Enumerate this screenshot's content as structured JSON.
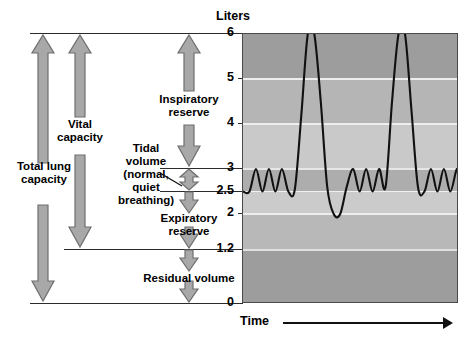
{
  "figure": {
    "y_axis_title": "Liters",
    "x_axis_title": "Time"
  },
  "chart_data": {
    "type": "line",
    "title": "",
    "xlabel": "Time",
    "ylabel": "Liters",
    "ylim": [
      0,
      6
    ],
    "yticks": [
      0,
      1.2,
      2,
      2.5,
      3,
      4,
      5,
      6
    ],
    "ytick_labels": [
      "0",
      "1.2",
      "2",
      "2.5",
      "3",
      "4",
      "5",
      "6"
    ],
    "grid": true,
    "legend": "none",
    "series": [
      {
        "name": "Spirogram trace",
        "x": [
          0,
          3,
          6,
          9,
          12,
          15,
          18,
          21,
          24,
          27,
          30,
          33,
          36,
          39,
          42,
          45,
          48,
          51,
          54,
          57,
          60,
          63,
          66,
          69,
          72,
          75,
          78,
          81,
          84,
          87,
          90,
          93,
          96,
          99,
          100
        ],
        "y": [
          2.5,
          2.5,
          3.0,
          2.5,
          3.0,
          2.5,
          3.0,
          2.5,
          2.55,
          4.2,
          6.0,
          6.0,
          4.5,
          2.6,
          2.0,
          2.0,
          2.6,
          3.0,
          2.5,
          3.0,
          2.5,
          3.0,
          2.6,
          4.5,
          6.0,
          6.0,
          4.3,
          2.6,
          2.5,
          3.0,
          2.5,
          3.0,
          2.5,
          3.0,
          2.6
        ]
      }
    ],
    "bands": [
      {
        "name": "inspiratory-reserve-upper",
        "from": 5,
        "to": 6,
        "color": "#9d9d9d"
      },
      {
        "name": "inspiratory-reserve-mid",
        "from": 4,
        "to": 5,
        "color": "#b5b5b5"
      },
      {
        "name": "inspiratory-reserve-low",
        "from": 3,
        "to": 4,
        "color": "#c9c9c9"
      },
      {
        "name": "tidal-volume-band",
        "from": 2.5,
        "to": 3,
        "color": "#adadad"
      },
      {
        "name": "expiratory-reserve-upper",
        "from": 2,
        "to": 2.5,
        "color": "#c9c9c9"
      },
      {
        "name": "expiratory-reserve-lower",
        "from": 1.2,
        "to": 2,
        "color": "#b8b8b8"
      },
      {
        "name": "residual-volume-band",
        "from": 0,
        "to": 1.2,
        "color": "#9d9d9d"
      }
    ]
  },
  "measures": {
    "total_lung_capacity": {
      "label": "Total lung\ncapacity",
      "top": 6,
      "bottom": 0
    },
    "vital_capacity": {
      "label": "Vital\ncapacity",
      "top": 6,
      "bottom": 1.2
    },
    "inspiratory_reserve": {
      "label": "Inspiratory\nreserve",
      "top": 6,
      "bottom": 3
    },
    "tidal_volume": {
      "label": "Tidal\nvolume\n(normal,\nquiet\nbreathing)",
      "top": 3,
      "bottom": 2.5
    },
    "expiratory_reserve": {
      "label": "Expiratory\nreserve",
      "top": 2.5,
      "bottom": 1.2
    },
    "residual_volume": {
      "label": "Residual volume",
      "top": 1.2,
      "bottom": 0
    }
  },
  "colors": {
    "arrow_fill": "#a8a8a8",
    "arrow_stroke": "#6e6e6e",
    "line": "#111111",
    "axis": "#2b2b2b"
  }
}
